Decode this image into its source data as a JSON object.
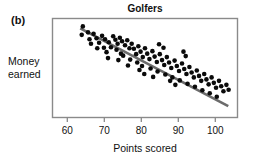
{
  "figure": {
    "panel_label": "(b)",
    "title": "Golfers",
    "ylabel_line1": "Money",
    "ylabel_line2": "earned",
    "xlabel": "Points scored"
  },
  "chart_data": {
    "type": "scatter",
    "title": "Golfers",
    "xlabel": "Points scored",
    "ylabel": "Money earned",
    "xlim": [
      56,
      106
    ],
    "ylim": [
      0,
      100
    ],
    "grid": false,
    "legend": null,
    "xticks": [
      60,
      70,
      80,
      90,
      100
    ],
    "xtick_labels": [
      "60",
      "70",
      "80",
      "90",
      "100"
    ],
    "yticks": [],
    "ytick_labels": [],
    "marker": {
      "shape": "circle",
      "color": "#0a0a0a",
      "size_px": 4.6
    },
    "trendline": {
      "show": true,
      "color": "#6b6b6b",
      "width_px": 2.6,
      "x_start": 63.5,
      "y_start": 90.0,
      "x_end": 103.5,
      "y_end": 11.5
    },
    "annotation": "(b)",
    "correlation": "negative",
    "n_points": 92,
    "points": [
      [
        64.2,
        92.0
      ],
      [
        65.6,
        86.0
      ],
      [
        63.9,
        83.5
      ],
      [
        66.0,
        79.0
      ],
      [
        67.1,
        84.5
      ],
      [
        67.9,
        80.0
      ],
      [
        66.4,
        74.5
      ],
      [
        68.6,
        75.5
      ],
      [
        69.4,
        82.5
      ],
      [
        70.2,
        79.0
      ],
      [
        68.1,
        70.0
      ],
      [
        69.9,
        70.5
      ],
      [
        71.2,
        76.0
      ],
      [
        71.8,
        71.0
      ],
      [
        70.6,
        66.0
      ],
      [
        72.4,
        82.0
      ],
      [
        73.0,
        78.5
      ],
      [
        73.6,
        74.5
      ],
      [
        74.2,
        80.5
      ],
      [
        74.8,
        77.0
      ],
      [
        73.3,
        68.5
      ],
      [
        74.5,
        64.5
      ],
      [
        75.6,
        73.0
      ],
      [
        76.2,
        78.0
      ],
      [
        76.8,
        70.0
      ],
      [
        75.1,
        62.5
      ],
      [
        77.4,
        74.5
      ],
      [
        78.0,
        69.5
      ],
      [
        78.6,
        64.0
      ],
      [
        77.0,
        58.5
      ],
      [
        79.2,
        72.0
      ],
      [
        79.8,
        66.5
      ],
      [
        80.4,
        61.0
      ],
      [
        78.9,
        55.5
      ],
      [
        81.0,
        70.0
      ],
      [
        81.6,
        64.5
      ],
      [
        82.2,
        59.0
      ],
      [
        80.2,
        52.0
      ],
      [
        83.0,
        67.0
      ],
      [
        83.6,
        61.5
      ],
      [
        84.2,
        56.0
      ],
      [
        82.5,
        49.5
      ],
      [
        85.0,
        64.0
      ],
      [
        85.6,
        58.0
      ],
      [
        86.2,
        53.0
      ],
      [
        84.4,
        46.5
      ],
      [
        86.9,
        61.0
      ],
      [
        87.5,
        55.5
      ],
      [
        88.1,
        50.0
      ],
      [
        86.5,
        43.5
      ],
      [
        89.0,
        57.5
      ],
      [
        89.6,
        52.0
      ],
      [
        90.2,
        47.0
      ],
      [
        88.4,
        40.5
      ],
      [
        91.0,
        54.5
      ],
      [
        91.6,
        49.0
      ],
      [
        92.2,
        44.0
      ],
      [
        90.4,
        37.5
      ],
      [
        93.0,
        51.0
      ],
      [
        93.6,
        45.5
      ],
      [
        94.2,
        40.5
      ],
      [
        92.5,
        34.0
      ],
      [
        95.0,
        47.5
      ],
      [
        95.6,
        42.0
      ],
      [
        96.2,
        37.0
      ],
      [
        94.5,
        31.0
      ],
      [
        97.0,
        44.0
      ],
      [
        97.6,
        38.5
      ],
      [
        98.2,
        33.5
      ],
      [
        96.5,
        27.5
      ],
      [
        99.0,
        40.5
      ],
      [
        99.6,
        35.0
      ],
      [
        100.2,
        30.0
      ],
      [
        98.5,
        24.5
      ],
      [
        101.0,
        37.0
      ],
      [
        101.6,
        31.5
      ],
      [
        102.2,
        26.5
      ],
      [
        100.4,
        21.0
      ],
      [
        103.0,
        33.0
      ],
      [
        103.6,
        28.0
      ],
      [
        92.0,
        62.0
      ],
      [
        91.4,
        66.5
      ],
      [
        86.0,
        70.5
      ],
      [
        84.8,
        74.0
      ],
      [
        80.8,
        44.0
      ],
      [
        83.2,
        41.0
      ],
      [
        87.8,
        37.0
      ],
      [
        89.2,
        33.0
      ],
      [
        71.0,
        60.0
      ],
      [
        73.8,
        58.0
      ],
      [
        76.4,
        52.5
      ],
      [
        79.5,
        48.0
      ]
    ]
  }
}
